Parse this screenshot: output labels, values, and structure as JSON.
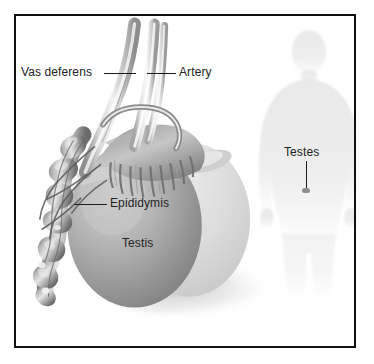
{
  "figure": {
    "style": "grayscale medical illustration",
    "border_color": "#111111",
    "background_color": "#ffffff",
    "text_color": "#232323",
    "leader_color": "#1c1c1c"
  },
  "labels": {
    "vas_deferens": "Vas deferens",
    "artery": "Artery",
    "epididymis": "Epididymis",
    "testis": "Testis",
    "testes": "Testes"
  },
  "icons": {
    "body_silhouette": "human-body-silhouette-icon",
    "testes_marker": "location-marker-icon"
  },
  "diagram_parts": [
    {
      "name": "vas-deferens",
      "description": "tubular cord descending from top, labeled left"
    },
    {
      "name": "testicular-artery",
      "description": "parallel vessel beside vas deferens, labeled right"
    },
    {
      "name": "epididymis-head",
      "description": "frilly branching structure on top of testis"
    },
    {
      "name": "epididymis-body-tail",
      "description": "lumpy convoluted tube on left side"
    },
    {
      "name": "testis-front",
      "description": "large dark grey ovoid, main testis"
    },
    {
      "name": "testis-back",
      "description": "lighter grey ovoid partially behind front testis"
    },
    {
      "name": "cast-shadow",
      "description": "soft shadow at lower right of testis"
    }
  ]
}
